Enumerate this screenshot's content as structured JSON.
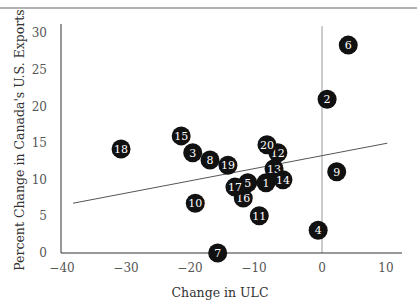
{
  "chart_data": {
    "type": "scatter",
    "title": "",
    "xlabel": "Change in ULC",
    "ylabel": "Percent Change in Canada's U.S. Exports",
    "xlim": [
      -40,
      12
    ],
    "ylim": [
      0,
      30
    ],
    "x_ticks": [
      -40,
      -30,
      -20,
      -10,
      0,
      10
    ],
    "x_tick_labels": [
      "−40",
      "−30",
      "−20",
      "−10",
      "0",
      "10"
    ],
    "y_ticks": [
      0,
      5,
      10,
      15,
      20,
      25,
      30
    ],
    "y_tick_labels": [
      "0",
      "5",
      "10",
      "15",
      "20",
      "25",
      "30"
    ],
    "grid": false,
    "legend": null,
    "reference_lines": [
      {
        "type": "vertical",
        "x": 0,
        "from_y": 0,
        "to_y": 31
      }
    ],
    "trend_line": {
      "x1": -38.9,
      "y1": 6.8,
      "x2": 10.2,
      "y2": 15.0
    },
    "points": [
      {
        "label": "1",
        "x": -8.75,
        "y": 9.6
      },
      {
        "label": "2",
        "x": 0.8,
        "y": 21.0
      },
      {
        "label": "3",
        "x": -20.2,
        "y": 13.7
      },
      {
        "label": "4",
        "x": -0.6,
        "y": 3.1
      },
      {
        "label": "5",
        "x": -11.6,
        "y": 9.6
      },
      {
        "label": "6",
        "x": 4.1,
        "y": 28.4
      },
      {
        "label": "7",
        "x": -16.3,
        "y": 0.0
      },
      {
        "label": "8",
        "x": -17.5,
        "y": 12.7
      },
      {
        "label": "9",
        "x": 2.3,
        "y": 11.1
      },
      {
        "label": "10",
        "x": -19.8,
        "y": 6.8
      },
      {
        "label": "11",
        "x": -9.8,
        "y": 5.1
      },
      {
        "label": "12",
        "x": -6.9,
        "y": 13.7
      },
      {
        "label": "13",
        "x": -7.5,
        "y": 11.5
      },
      {
        "label": "14",
        "x": -6.1,
        "y": 10.0
      },
      {
        "label": "15",
        "x": -22.0,
        "y": 16.0
      },
      {
        "label": "16",
        "x": -12.3,
        "y": 7.5
      },
      {
        "label": "17",
        "x": -13.6,
        "y": 9.0
      },
      {
        "label": "18",
        "x": -31.4,
        "y": 14.2
      },
      {
        "label": "19",
        "x": -14.7,
        "y": 12.0
      },
      {
        "label": "20",
        "x": -8.6,
        "y": 14.8
      }
    ],
    "colors": {
      "marker_fill": "#111111",
      "marker_text": "#ffffff",
      "axis": "#333333",
      "reference_line": "#999999",
      "trend_line": "#555555",
      "top_rule": "#999999"
    }
  }
}
